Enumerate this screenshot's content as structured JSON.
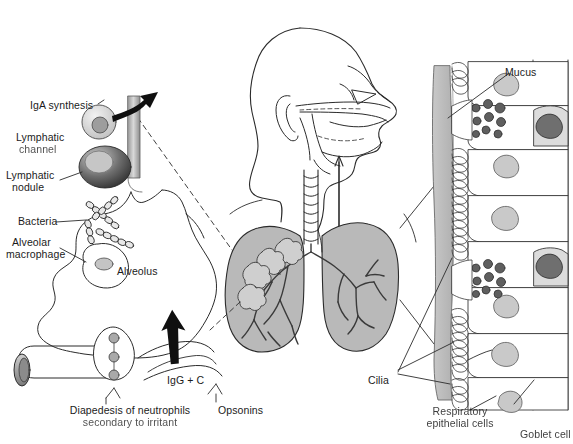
{
  "figure": {
    "background_color": "#ffffff",
    "line_color": "#2b2b2b",
    "fill_light": "#d8d8d8",
    "fill_mid": "#b3b3b3",
    "fill_dark": "#5a5a5a",
    "width": 573,
    "height": 444
  },
  "labels": {
    "iga_synthesis": "IgA synthesis",
    "lymphatic_channel_l1": "Lymphatic",
    "lymphatic_channel_l2": "channel",
    "lymphatic_nodule_l1": "Lymphatic",
    "lymphatic_nodule_l2": "nodule",
    "bacteria": "Bacteria",
    "alveolar_macrophage_l1": "Alveolar",
    "alveolar_macrophage_l2": "macrophage",
    "alveolus": "Alveolus",
    "igg_c": "IgG + C",
    "diapedesis_l1": "Diapedesis of neutrophils",
    "diapedesis_l2": "secondary to irritant",
    "opsonins": "Opsonins",
    "mucus": "Mucus",
    "cilia": "Cilia",
    "respiratory_epithelial_l1": "Respiratory",
    "respiratory_epithelial_l2": "epithelial cells",
    "goblet_cell": "Goblet cell"
  },
  "structures": {
    "head": "sagittal-head-profile",
    "nasal_cavity": "nasal-cavity",
    "pharynx": "pharynx",
    "trachea": "trachea",
    "lung_left": "left-lung",
    "lung_right": "right-lung",
    "bronchial_tree": "bronchial-tree",
    "alveolar_clusters": "alveolar-clusters",
    "capillary": "capillary",
    "epithelium_column": "respiratory-epithelium",
    "mucus_layer": "mucus-layer"
  },
  "airflow": {
    "inhalation_arrow": "down-arrow-trachea",
    "exhalation_arrow": "up-arrow-pharynx",
    "iga_arrow": "curved-arrow-iga",
    "igg_arrow": "up-arrow-igg"
  }
}
